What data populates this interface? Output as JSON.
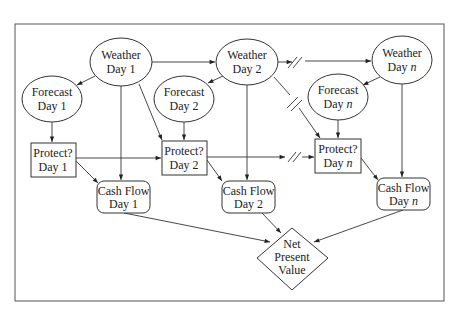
{
  "diagram": {
    "type": "influence-diagram",
    "nodes": {
      "weather_1": {
        "line1": "Weather",
        "line2": "Day",
        "idx": "1"
      },
      "weather_2": {
        "line1": "Weather",
        "line2": "Day",
        "idx": "2"
      },
      "weather_n": {
        "line1": "Weather",
        "line2": "Day",
        "idx": "n"
      },
      "forecast_1": {
        "line1": "Forecast",
        "line2": "Day",
        "idx": "1"
      },
      "forecast_2": {
        "line1": "Forecast",
        "line2": "Day",
        "idx": "2"
      },
      "forecast_n": {
        "line1": "Forecast",
        "line2": "Day",
        "idx": "n"
      },
      "protect_1": {
        "line1": "Protect?",
        "line2": "Day",
        "idx": "1"
      },
      "protect_2": {
        "line1": "Protect?",
        "line2": "Day",
        "idx": "2"
      },
      "protect_n": {
        "line1": "Protect?",
        "line2": "Day",
        "idx": "n"
      },
      "cash_1": {
        "line1": "Cash Flow",
        "line2": "Day",
        "idx": "1"
      },
      "cash_2": {
        "line1": "Cash Flow",
        "line2": "Day",
        "idx": "2"
      },
      "cash_n": {
        "line1": "Cash Flow",
        "line2": "Day",
        "idx": "n"
      },
      "npv": {
        "line1": "Net",
        "line2": "Present",
        "line3": "Value"
      }
    },
    "node_shapes": {
      "chance": "ellipse",
      "decision": "rectangle",
      "deterministic": "rounded-rectangle",
      "value": "diamond"
    },
    "edges": [
      [
        "weather_1",
        "weather_2"
      ],
      [
        "weather_2",
        "weather_n"
      ],
      [
        "weather_1",
        "forecast_1"
      ],
      [
        "weather_2",
        "forecast_2"
      ],
      [
        "weather_n",
        "forecast_n"
      ],
      [
        "forecast_1",
        "protect_1"
      ],
      [
        "forecast_2",
        "protect_2"
      ],
      [
        "forecast_n",
        "protect_n"
      ],
      [
        "weather_1",
        "protect_2"
      ],
      [
        "weather_2",
        "protect_n"
      ],
      [
        "protect_1",
        "protect_2"
      ],
      [
        "protect_2",
        "protect_n"
      ],
      [
        "weather_1",
        "cash_1"
      ],
      [
        "weather_2",
        "cash_2"
      ],
      [
        "weather_n",
        "cash_n"
      ],
      [
        "protect_1",
        "cash_1"
      ],
      [
        "protect_2",
        "cash_2"
      ],
      [
        "protect_n",
        "cash_n"
      ],
      [
        "cash_1",
        "npv"
      ],
      [
        "cash_2",
        "npv"
      ],
      [
        "cash_n",
        "npv"
      ]
    ],
    "colors": {
      "stroke": "#333333",
      "background": "#ffffff",
      "text": "#222222"
    }
  }
}
